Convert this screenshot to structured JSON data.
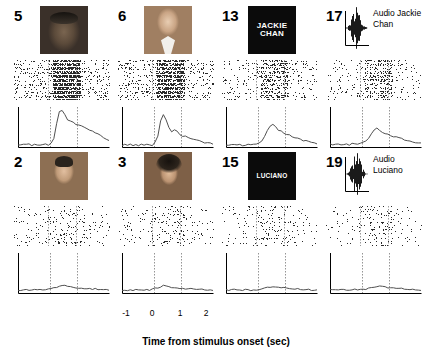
{
  "figure": {
    "xaxis_title": "Time from stimulus onset (sec)",
    "xticks": [
      "-1",
      "0",
      "1",
      "2"
    ],
    "xlim": [
      -1.2,
      2.2
    ],
    "stim_window": [
      0,
      1
    ],
    "panels": [
      {
        "number": "5",
        "stimulus_type": "face-photo",
        "stimulus_name": "face-weathered-man",
        "row": 0,
        "col": 0
      },
      {
        "number": "6",
        "stimulus_type": "face-photo",
        "stimulus_name": "face-smiling-man-suit",
        "row": 0,
        "col": 1
      },
      {
        "number": "13",
        "stimulus_type": "word-image",
        "stimulus_name": "word-jackie-chan",
        "stimulus_text": "JACKIE CHAN",
        "row": 0,
        "col": 2
      },
      {
        "number": "17",
        "stimulus_type": "audio",
        "stimulus_name": "audio-jackie-chan",
        "stimulus_text": "Audio Jackie Chan",
        "row": 0,
        "col": 3
      },
      {
        "number": "2",
        "stimulus_type": "face-photo",
        "stimulus_name": "face-young-man-dark-hair",
        "row": 1,
        "col": 0
      },
      {
        "number": "3",
        "stimulus_type": "face-photo",
        "stimulus_name": "face-long-haired-man",
        "row": 1,
        "col": 1
      },
      {
        "number": "15",
        "stimulus_type": "word-image",
        "stimulus_name": "word-luciano",
        "stimulus_text": "LUCIANO",
        "row": 1,
        "col": 2
      },
      {
        "number": "19",
        "stimulus_type": "audio",
        "stimulus_name": "audio-luciano",
        "stimulus_text": "Audio Luciano",
        "row": 1,
        "col": 3
      }
    ]
  },
  "chart_data": {
    "type": "line",
    "title": "",
    "xlabel": "Time from stimulus onset (sec)",
    "ylabel": "",
    "xlim": [
      -1.2,
      2.2
    ],
    "xticks": [
      -1,
      0,
      1,
      2
    ],
    "grid": false,
    "stimulus_onset": 0,
    "stimulus_offset": 1,
    "panel_histograms": [
      {
        "panel": "5",
        "baseline": 0.1,
        "peak_time": 0.35,
        "peak_value": 1.0,
        "values": [
          0.06,
          0.05,
          0.08,
          0.06,
          0.07,
          0.05,
          0.09,
          0.06,
          0.05,
          0.08,
          0.07,
          0.06,
          0.1,
          0.22,
          0.62,
          0.95,
          1.0,
          0.86,
          0.74,
          0.7,
          0.66,
          0.62,
          0.58,
          0.56,
          0.52,
          0.49,
          0.45,
          0.42,
          0.38,
          0.34,
          0.3,
          0.26,
          0.22,
          0.18
        ]
      },
      {
        "panel": "6",
        "baseline": 0.08,
        "peak_time": 0.3,
        "peak_value": 0.88,
        "values": [
          0.05,
          0.06,
          0.04,
          0.07,
          0.05,
          0.06,
          0.05,
          0.08,
          0.05,
          0.06,
          0.07,
          0.05,
          0.12,
          0.3,
          0.7,
          0.88,
          0.74,
          0.52,
          0.4,
          0.46,
          0.42,
          0.34,
          0.3,
          0.28,
          0.24,
          0.22,
          0.2,
          0.18,
          0.16,
          0.14,
          0.12,
          0.11,
          0.1,
          0.09
        ]
      },
      {
        "panel": "13",
        "baseline": 0.08,
        "peak_time": 0.45,
        "peak_value": 0.62,
        "values": [
          0.06,
          0.05,
          0.07,
          0.05,
          0.06,
          0.08,
          0.05,
          0.06,
          0.07,
          0.05,
          0.06,
          0.08,
          0.1,
          0.16,
          0.3,
          0.44,
          0.56,
          0.62,
          0.54,
          0.46,
          0.42,
          0.38,
          0.34,
          0.32,
          0.28,
          0.26,
          0.24,
          0.2,
          0.18,
          0.16,
          0.14,
          0.12,
          0.11,
          0.1
        ]
      },
      {
        "panel": "17",
        "baseline": 0.09,
        "peak_time": 0.55,
        "peak_value": 0.52,
        "values": [
          0.07,
          0.06,
          0.08,
          0.07,
          0.06,
          0.08,
          0.07,
          0.06,
          0.09,
          0.07,
          0.08,
          0.1,
          0.12,
          0.16,
          0.24,
          0.34,
          0.44,
          0.52,
          0.46,
          0.4,
          0.36,
          0.34,
          0.3,
          0.28,
          0.26,
          0.24,
          0.22,
          0.2,
          0.18,
          0.16,
          0.15,
          0.13,
          0.12,
          0.1
        ]
      },
      {
        "panel": "2",
        "baseline": 0.1,
        "peak_time": 0.5,
        "peak_value": 0.22,
        "values": [
          0.08,
          0.07,
          0.09,
          0.08,
          0.07,
          0.09,
          0.08,
          0.1,
          0.08,
          0.09,
          0.07,
          0.1,
          0.11,
          0.13,
          0.16,
          0.18,
          0.2,
          0.22,
          0.19,
          0.17,
          0.16,
          0.15,
          0.14,
          0.13,
          0.13,
          0.12,
          0.12,
          0.11,
          0.11,
          0.1,
          0.1,
          0.09,
          0.09,
          0.08
        ]
      },
      {
        "panel": "3",
        "baseline": 0.09,
        "peak_time": 0.4,
        "peak_value": 0.2,
        "values": [
          0.07,
          0.08,
          0.07,
          0.09,
          0.07,
          0.08,
          0.09,
          0.07,
          0.08,
          0.09,
          0.08,
          0.1,
          0.12,
          0.14,
          0.17,
          0.2,
          0.18,
          0.16,
          0.15,
          0.15,
          0.14,
          0.13,
          0.12,
          0.12,
          0.11,
          0.11,
          0.1,
          0.1,
          0.09,
          0.09,
          0.08,
          0.08,
          0.07,
          0.07
        ]
      },
      {
        "panel": "15",
        "baseline": 0.09,
        "peak_time": 0.6,
        "peak_value": 0.18,
        "values": [
          0.08,
          0.07,
          0.08,
          0.09,
          0.07,
          0.08,
          0.07,
          0.09,
          0.08,
          0.07,
          0.09,
          0.08,
          0.1,
          0.11,
          0.12,
          0.14,
          0.16,
          0.18,
          0.16,
          0.15,
          0.14,
          0.14,
          0.13,
          0.12,
          0.12,
          0.11,
          0.11,
          0.1,
          0.1,
          0.09,
          0.09,
          0.08,
          0.08,
          0.08
        ]
      },
      {
        "panel": "19",
        "baseline": 0.1,
        "peak_time": 0.7,
        "peak_value": 0.2,
        "values": [
          0.08,
          0.09,
          0.08,
          0.07,
          0.09,
          0.08,
          0.09,
          0.08,
          0.07,
          0.09,
          0.08,
          0.09,
          0.1,
          0.11,
          0.12,
          0.13,
          0.15,
          0.17,
          0.2,
          0.18,
          0.16,
          0.15,
          0.14,
          0.14,
          0.13,
          0.12,
          0.12,
          0.11,
          0.11,
          0.1,
          0.1,
          0.09,
          0.09,
          0.08
        ]
      }
    ],
    "rasters": [
      {
        "panel": "5",
        "trials": 30,
        "baseline_rate": 0.1,
        "response_rate": 0.62
      },
      {
        "panel": "6",
        "trials": 30,
        "baseline_rate": 0.1,
        "response_rate": 0.54
      },
      {
        "panel": "13",
        "trials": 30,
        "baseline_rate": 0.05,
        "response_rate": 0.26
      },
      {
        "panel": "17",
        "trials": 30,
        "baseline_rate": 0.05,
        "response_rate": 0.22
      },
      {
        "panel": "2",
        "trials": 30,
        "baseline_rate": 0.04,
        "response_rate": 0.09
      },
      {
        "panel": "3",
        "trials": 30,
        "baseline_rate": 0.04,
        "response_rate": 0.08
      },
      {
        "panel": "15",
        "trials": 30,
        "baseline_rate": 0.03,
        "response_rate": 0.07
      },
      {
        "panel": "19",
        "trials": 30,
        "baseline_rate": 0.03,
        "response_rate": 0.07
      }
    ]
  }
}
